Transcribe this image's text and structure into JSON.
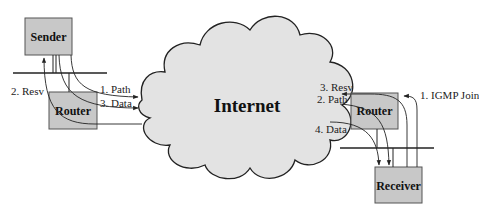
{
  "diagram": {
    "type": "network-signaling",
    "colors": {
      "box_fill": "#c8c8c8",
      "box_stroke": "#555555",
      "cloud_fill": "#e3e3e3",
      "cloud_stroke": "#222222",
      "line": "#222222"
    },
    "nodes": {
      "sender": {
        "label": "Sender"
      },
      "sender_router": {
        "label": "Router"
      },
      "internet": {
        "label": "Internet"
      },
      "receiver_router": {
        "label": "Router"
      },
      "receiver": {
        "label": "Receiver"
      }
    },
    "flows": {
      "sender_side": {
        "path": "1. Path",
        "data": "3. Data",
        "resv": "2. Resv"
      },
      "receiver_side": {
        "resv": "3. Resv",
        "path": "2. Path",
        "data": "4. Data",
        "igmp": "1. IGMP Join"
      }
    }
  }
}
